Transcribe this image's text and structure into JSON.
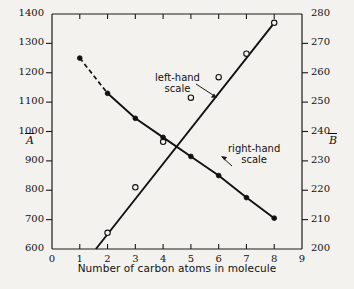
{
  "chart_data": {
    "type": "line",
    "title": "",
    "xlabel": "Number of carbon atoms in molecule",
    "ylabel": "Ā",
    "y2label": "B̄",
    "xlim": [
      0,
      9
    ],
    "ylim": [
      600,
      1400
    ],
    "y2lim": [
      200,
      280
    ],
    "xticks": [
      0,
      1,
      2,
      3,
      4,
      5,
      6,
      7,
      8,
      9
    ],
    "xticklabels": [
      "0",
      "1",
      "2",
      "3",
      "4",
      "5",
      "6",
      "7",
      "8",
      "9"
    ],
    "yticks": [
      600,
      700,
      800,
      900,
      1000,
      1100,
      1200,
      1300,
      1400
    ],
    "yticklabels": [
      "600",
      "700",
      "800",
      "900",
      "1000",
      "1100",
      "1200",
      "1300",
      "1400"
    ],
    "y2ticks": [
      200,
      210,
      220,
      230,
      240,
      250,
      260,
      270,
      280
    ],
    "y2ticklabels": [
      "200",
      "210",
      "220",
      "230",
      "240",
      "250",
      "260",
      "270",
      "280"
    ],
    "grid": false,
    "legend": "annotations",
    "series": [
      {
        "name": "left-hand scale",
        "axis": "left",
        "marker": "open-circle",
        "linestyle": "solid",
        "x": [
          2,
          3,
          4,
          5,
          6,
          7,
          8
        ],
        "values": [
          655,
          810,
          965,
          1115,
          1185,
          1265,
          1370
        ],
        "line_start": [
          1.58,
          600
        ],
        "line_end": [
          8,
          1370
        ]
      },
      {
        "name": "right-hand scale",
        "axis": "right",
        "marker": "filled-circle",
        "linestyle": "solid-with-leading-dashed",
        "x": [
          1,
          2,
          3,
          4,
          5,
          6,
          7,
          8
        ],
        "values": [
          265,
          253,
          244.5,
          238,
          231.5,
          225,
          217.5,
          210.5
        ],
        "dashed_segment": [
          1,
          2
        ]
      }
    ],
    "annotations": [
      {
        "name": "left-hand-scale",
        "text_line1": "left-hand",
        "text_line2": "scale",
        "text": "left-hand scale",
        "points_to": "rising-open-circle-series"
      },
      {
        "name": "right-hand-scale",
        "text_line1": "right-hand",
        "text_line2": "scale",
        "text": "right-hand scale",
        "points_to": "descending-filled-circle-series"
      }
    ],
    "colors": {
      "background": "#f4f2ee",
      "axis": "#1a1a1a",
      "series_left": "#111111",
      "series_right": "#111111"
    }
  }
}
